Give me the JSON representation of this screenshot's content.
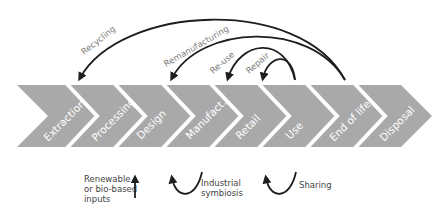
{
  "colors": {
    "chevron": "#a9a9a9",
    "arrow": "#1e1e1e",
    "stage_text": "#ffffff",
    "loop_text": "#7a7a7a",
    "side_text": "#444444"
  },
  "stages": [
    {
      "label": "Extraction"
    },
    {
      "label": "Processing"
    },
    {
      "label": "Design"
    },
    {
      "label": "Manufact."
    },
    {
      "label": "Retail"
    },
    {
      "label": "Use"
    },
    {
      "label": "End of life"
    },
    {
      "label": "Disposal"
    }
  ],
  "loops": {
    "recycling": "Recycling",
    "remanufacturing": "Remanufacturing",
    "reuse": "Re-use",
    "repair": "Repair"
  },
  "bottom": {
    "inputs_line1": "Renewable",
    "inputs_line2": "or bio-based",
    "inputs_line3": "inputs",
    "symbiosis_line1": "Industrial",
    "symbiosis_line2": "symbiosis",
    "sharing": "Sharing"
  }
}
